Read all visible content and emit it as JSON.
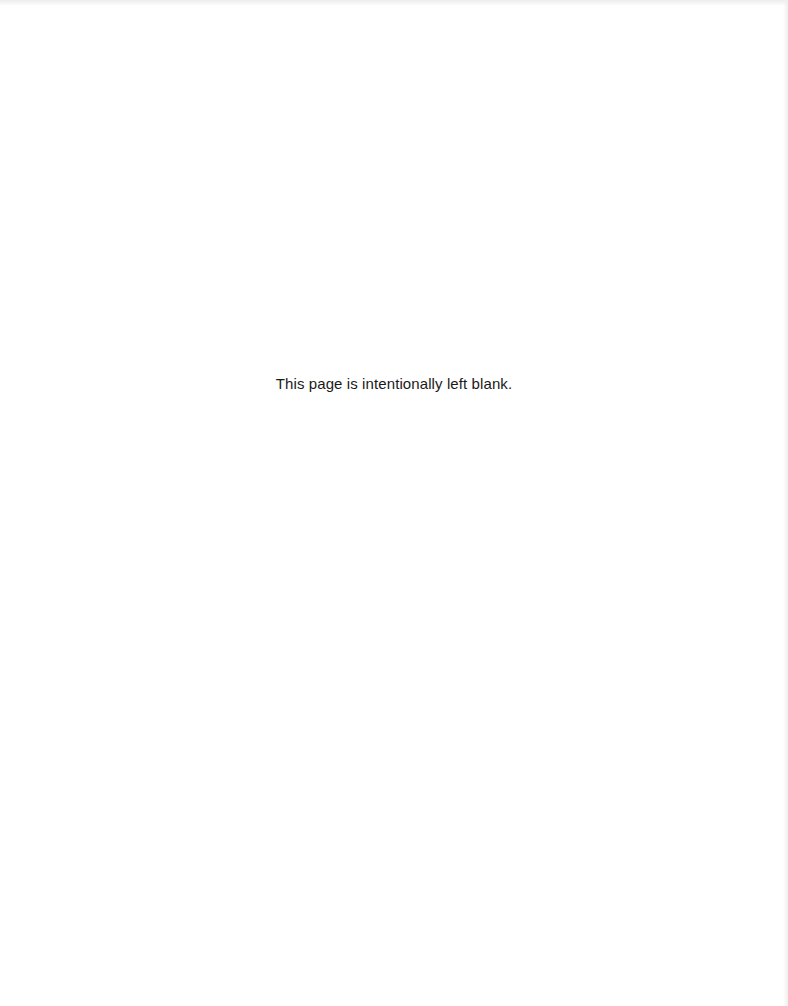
{
  "page": {
    "notice_text": "This page is intentionally left blank."
  }
}
